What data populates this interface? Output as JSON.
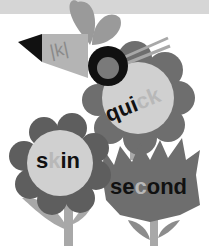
{
  "illustration": {
    "bee_label": "|k|",
    "flowers": [
      {
        "name": "quick",
        "prefix": "qui",
        "highlight": "ck",
        "suffix": ""
      },
      {
        "name": "skin",
        "prefix": "s",
        "highlight": "k",
        "suffix": "in"
      },
      {
        "name": "second",
        "prefix": "se",
        "highlight": "c",
        "suffix": "ond"
      }
    ]
  },
  "colors": {
    "background": "#ffffff",
    "top_band": "#d6d6d6",
    "petal_dark": "#6e6e6e",
    "center_light": "#d0d0d0",
    "leaf": "#a8a8a8",
    "text": "#111111",
    "highlight_text": "#b8b8b8"
  }
}
